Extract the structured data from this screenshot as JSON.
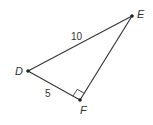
{
  "diagram": {
    "type": "right-triangle",
    "colors": {
      "stroke": "#3a3a3a",
      "text": "#333333",
      "background": "#ffffff"
    },
    "vertices": [
      {
        "name": "D",
        "x": 28,
        "y": 71
      },
      {
        "name": "E",
        "x": 132,
        "y": 16
      },
      {
        "name": "F",
        "x": 80,
        "y": 100
      }
    ],
    "sides": [
      {
        "from": "D",
        "to": "E",
        "label": "10"
      },
      {
        "from": "D",
        "to": "F",
        "label": "5"
      },
      {
        "from": "F",
        "to": "E",
        "label": ""
      }
    ],
    "right_angle_at": "F",
    "labels": {
      "D": "D",
      "E": "E",
      "F": "F",
      "DE": "10",
      "DF": "5"
    }
  }
}
